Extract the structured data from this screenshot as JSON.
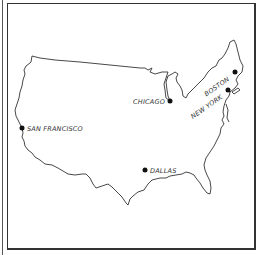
{
  "map": {
    "region": "Contiguous United States",
    "colors": {
      "background": "#ffffff",
      "outline": "#333333",
      "city_marker": "#111111",
      "label": "#333333"
    },
    "cities": [
      {
        "name": "SAN FRANCISCO",
        "x": 22,
        "y": 128,
        "label_x": 27,
        "label_y": 130,
        "label_rotation": 0,
        "anchor": "start"
      },
      {
        "name": "CHICAGO",
        "x": 170,
        "y": 101,
        "label_x": 165,
        "label_y": 103,
        "label_rotation": 0,
        "anchor": "end"
      },
      {
        "name": "BOSTON",
        "x": 235,
        "y": 72,
        "label_x": 228,
        "label_y": 82,
        "label_rotation": -35,
        "anchor": "end"
      },
      {
        "name": "NEW YORK",
        "x": 228,
        "y": 90,
        "label_x": 222,
        "label_y": 100,
        "label_rotation": -35,
        "anchor": "end"
      },
      {
        "name": "DALLAS",
        "x": 145,
        "y": 170,
        "label_x": 150,
        "label_y": 172,
        "label_rotation": 0,
        "anchor": "start"
      }
    ]
  }
}
